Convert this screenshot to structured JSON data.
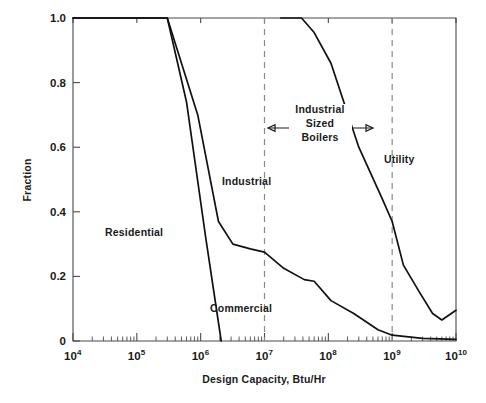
{
  "chart_data": {
    "type": "line",
    "title": "",
    "xlabel": "Design Capacity, Btu/Hr",
    "ylabel": "Fraction",
    "xscale": "log",
    "xlim": [
      10000,
      10000000000
    ],
    "ylim": [
      0,
      1.0
    ],
    "grid": false,
    "legend_position": "inline-annotations",
    "x_tick_labels": [
      "10",
      "10",
      "10",
      "10",
      "10",
      "10",
      "10"
    ],
    "x_tick_exponents": [
      "4",
      "5",
      "6",
      "7",
      "8",
      "9",
      "10"
    ],
    "x_tick_values": [
      10000,
      100000,
      1000000,
      10000000,
      100000000,
      1000000000,
      10000000000
    ],
    "y_tick_labels": [
      "0",
      "0.2",
      "0.4",
      "0.6",
      "0.8",
      "1.0"
    ],
    "y_tick_values": [
      0,
      0.2,
      0.4,
      0.6,
      0.8,
      1.0
    ],
    "series": [
      {
        "name": "Residential",
        "color": "#111111",
        "points": [
          [
            10000,
            1.0
          ],
          [
            300000,
            1.0
          ],
          [
            600000,
            0.74
          ],
          [
            1200000,
            0.32
          ],
          [
            2100000,
            0.0
          ]
        ]
      },
      {
        "name": "Commercial",
        "color": "#111111",
        "points": [
          [
            10000,
            1.0
          ],
          [
            300000,
            1.0
          ],
          [
            900000,
            0.7
          ],
          [
            1900000,
            0.37
          ],
          [
            3200000,
            0.3
          ],
          [
            6000000,
            0.285
          ],
          [
            10000000,
            0.275
          ],
          [
            20000000,
            0.225
          ],
          [
            42000000,
            0.19
          ],
          [
            60000000,
            0.185
          ],
          [
            110000000,
            0.125
          ],
          [
            250000000,
            0.085
          ],
          [
            600000000,
            0.035
          ],
          [
            1000000000,
            0.018
          ],
          [
            3000000000,
            0.008
          ],
          [
            10000000000,
            0.005
          ]
        ]
      },
      {
        "name": "Industrial Utility",
        "color": "#111111",
        "points": [
          [
            18000000,
            1.0
          ],
          [
            38000000,
            1.0
          ],
          [
            60000000,
            0.955
          ],
          [
            110000000,
            0.86
          ],
          [
            300000000,
            0.6
          ],
          [
            700000000,
            0.44
          ],
          [
            1000000000,
            0.37
          ],
          [
            1500000000,
            0.235
          ],
          [
            2600000000,
            0.155
          ],
          [
            4300000000,
            0.085
          ],
          [
            6000000000,
            0.065
          ],
          [
            10000000000,
            0.095
          ]
        ]
      }
    ],
    "dividers": [
      {
        "label": "industrial-divider",
        "x": 10000000
      },
      {
        "label": "utility-divider",
        "x": 1000000000
      }
    ],
    "annotations": [
      {
        "name": "residential-label",
        "text": "Residential",
        "x": 105,
        "y": 236
      },
      {
        "name": "commercial-label",
        "text": "Commercial",
        "x": 210,
        "y": 312
      },
      {
        "name": "industrial-label",
        "text": "Industrial",
        "x": 222,
        "y": 185
      },
      {
        "name": "utility-label",
        "text": "Utility",
        "x": 384,
        "y": 163
      },
      {
        "name": "industrial-sized-line1",
        "text": "Industrial",
        "x": 320,
        "y": 113
      },
      {
        "name": "industrial-sized-line2",
        "text": "Sized",
        "x": 320,
        "y": 127
      },
      {
        "name": "industrial-sized-line3",
        "text": "Boilers",
        "x": 320,
        "y": 141
      },
      {
        "name": "span-arrow-label",
        "text": "",
        "x": 0,
        "y": 0
      }
    ]
  }
}
